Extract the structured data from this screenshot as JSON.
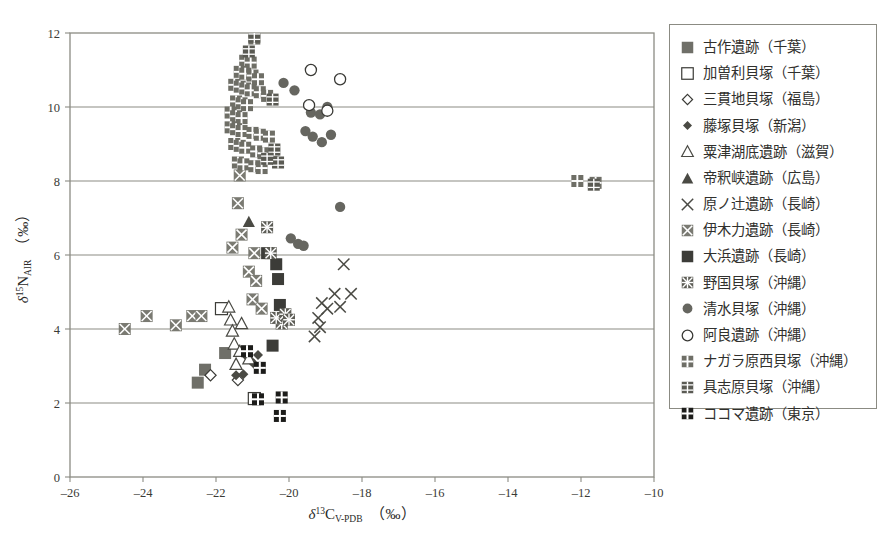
{
  "chart_data": {
    "type": "scatter",
    "title": "",
    "xlabel": "δ¹³C_V-PDB (‰)",
    "ylabel": "δ¹⁵N_AIR (‰)",
    "xlim": [
      -26,
      -10
    ],
    "ylim": [
      0,
      12
    ],
    "xticks": [
      -26,
      -24,
      -22,
      -20,
      -18,
      -16,
      -14,
      -12,
      -10
    ],
    "yticks": [
      0,
      2,
      4,
      6,
      8,
      10,
      12
    ],
    "xtick_labels": [
      "–26",
      "–24",
      "–22",
      "–20",
      "–18",
      "–16",
      "–14",
      "–12",
      "–10"
    ],
    "ytick_labels": [
      "0",
      "2",
      "4",
      "6",
      "8",
      "10",
      "12"
    ],
    "grid": "horizontal",
    "legend_position": "right-outside",
    "series": [
      {
        "name": "古作遺跡（千葉）",
        "marker": "filled-square",
        "color": "#6f6f68",
        "points": [
          [
            -22.3,
            2.9
          ],
          [
            -22.5,
            2.55
          ],
          [
            -21.75,
            3.35
          ]
        ]
      },
      {
        "name": "加曽利貝塚（千葉）",
        "marker": "open-square",
        "color": "#3a3a36",
        "points": [
          [
            -21.85,
            4.55
          ],
          [
            -20.95,
            2.12
          ]
        ]
      },
      {
        "name": "三貫地貝塚（福島）",
        "marker": "open-diamond",
        "color": "#3a3a36",
        "points": [
          [
            -22.15,
            2.75
          ],
          [
            -21.4,
            2.62
          ]
        ]
      },
      {
        "name": "藤塚貝塚（新潟）",
        "marker": "filled-diamond",
        "color": "#4a4a44",
        "points": [
          [
            -21.45,
            2.75
          ],
          [
            -21.25,
            2.78
          ],
          [
            -21.15,
            3.25
          ],
          [
            -21.05,
            3.15
          ],
          [
            -20.95,
            3.05
          ],
          [
            -20.85,
            3.3
          ]
        ]
      },
      {
        "name": "粟津湖底遺跡（滋賀）",
        "marker": "open-triangle",
        "color": "#4a4a44",
        "points": [
          [
            -21.65,
            4.6
          ],
          [
            -21.6,
            4.25
          ],
          [
            -21.55,
            3.95
          ],
          [
            -21.5,
            3.6
          ],
          [
            -21.35,
            3.4
          ],
          [
            -21.1,
            3.2
          ],
          [
            -21.3,
            4.15
          ],
          [
            -21.45,
            3.05
          ]
        ]
      },
      {
        "name": "帝釈峡遺跡（広島）",
        "marker": "filled-triangle",
        "color": "#4a4a44",
        "points": [
          [
            -21.1,
            6.9
          ]
        ]
      },
      {
        "name": "原ノ辻遺跡（長崎）",
        "marker": "cross-x",
        "color": "#4a4a44",
        "points": [
          [
            -18.5,
            5.75
          ],
          [
            -18.75,
            4.95
          ],
          [
            -18.3,
            4.95
          ],
          [
            -19.1,
            4.7
          ],
          [
            -18.95,
            4.55
          ],
          [
            -19.2,
            4.3
          ],
          [
            -19.15,
            4.05
          ],
          [
            -19.3,
            3.8
          ],
          [
            -18.6,
            4.6
          ]
        ]
      },
      {
        "name": "伊木力遺跡（長崎）",
        "marker": "x-in-square",
        "color": "#7a7a72",
        "points": [
          [
            -24.5,
            4.0
          ],
          [
            -23.9,
            4.35
          ],
          [
            -23.1,
            4.1
          ],
          [
            -22.65,
            4.35
          ],
          [
            -22.4,
            4.35
          ],
          [
            -21.4,
            7.4
          ],
          [
            -21.3,
            6.55
          ],
          [
            -21.55,
            6.2
          ],
          [
            -20.95,
            6.05
          ],
          [
            -21.0,
            4.8
          ],
          [
            -20.75,
            4.55
          ],
          [
            -21.35,
            8.15
          ],
          [
            -21.1,
            5.55
          ],
          [
            -20.9,
            5.3
          ]
        ]
      },
      {
        "name": "大浜遺跡（長崎）",
        "marker": "dark-square",
        "color": "#3c3c38",
        "points": [
          [
            -20.35,
            5.75
          ],
          [
            -20.3,
            5.35
          ],
          [
            -20.25,
            4.65
          ],
          [
            -20.6,
            6.05
          ],
          [
            -20.45,
            3.55
          ]
        ]
      },
      {
        "name": "野国貝塚（沖縄）",
        "marker": "asterisk-square",
        "color": "#5c5c55",
        "points": [
          [
            -20.6,
            6.75
          ],
          [
            -20.5,
            6.05
          ],
          [
            -20.2,
            4.15
          ],
          [
            -20.35,
            4.3
          ],
          [
            -20.1,
            4.4
          ],
          [
            -20.0,
            4.25
          ]
        ]
      },
      {
        "name": "清水貝塚（沖縄）",
        "marker": "filled-circle",
        "color": "#666660",
        "points": [
          [
            -19.4,
            9.85
          ],
          [
            -19.15,
            9.8
          ],
          [
            -18.95,
            10.0
          ],
          [
            -19.35,
            9.2
          ],
          [
            -19.1,
            9.05
          ],
          [
            -18.85,
            9.25
          ],
          [
            -19.55,
            9.35
          ],
          [
            -18.6,
            7.3
          ],
          [
            -19.95,
            6.45
          ],
          [
            -19.75,
            6.3
          ],
          [
            -19.6,
            6.25
          ],
          [
            -20.15,
            10.65
          ],
          [
            -19.85,
            10.45
          ]
        ]
      },
      {
        "name": "阿良遺跡（沖縄）",
        "marker": "open-circle",
        "color": "#3a3a36",
        "points": [
          [
            -19.4,
            11.0
          ],
          [
            -18.6,
            10.75
          ],
          [
            -19.45,
            10.05
          ],
          [
            -18.95,
            9.9
          ]
        ]
      },
      {
        "name": "ナガラ原西貝塚（沖縄）",
        "marker": "plus-square-light",
        "color": "#6e6e66",
        "points": [
          [
            -20.95,
            11.85
          ],
          [
            -21.2,
            11.25
          ],
          [
            -21.05,
            11.2
          ],
          [
            -21.35,
            10.95
          ],
          [
            -21.2,
            10.9
          ],
          [
            -21.0,
            10.85
          ],
          [
            -20.85,
            10.75
          ],
          [
            -21.5,
            10.6
          ],
          [
            -21.35,
            10.55
          ],
          [
            -21.2,
            10.5
          ],
          [
            -21.05,
            10.45
          ],
          [
            -20.8,
            10.4
          ],
          [
            -20.6,
            10.3
          ],
          [
            -21.45,
            10.15
          ],
          [
            -21.3,
            10.1
          ],
          [
            -21.15,
            10.05
          ],
          [
            -21.6,
            9.85
          ],
          [
            -21.45,
            9.75
          ],
          [
            -21.3,
            9.7
          ],
          [
            -21.6,
            9.45
          ],
          [
            -21.45,
            9.4
          ],
          [
            -21.3,
            9.35
          ],
          [
            -21.0,
            9.3
          ],
          [
            -20.8,
            9.25
          ],
          [
            -20.55,
            9.2
          ],
          [
            -21.5,
            9.0
          ],
          [
            -21.35,
            8.95
          ],
          [
            -21.2,
            8.9
          ],
          [
            -20.9,
            8.8
          ],
          [
            -20.7,
            8.75
          ],
          [
            -20.45,
            8.7
          ],
          [
            -21.4,
            8.5
          ],
          [
            -21.25,
            8.45
          ],
          [
            -20.95,
            8.4
          ],
          [
            -20.75,
            8.35
          ],
          [
            -11.6,
            7.95
          ],
          [
            -12.1,
            8.0
          ]
        ]
      },
      {
        "name": "具志原貝塚（沖縄）",
        "marker": "grid-square",
        "color": "#5a5a53",
        "points": [
          [
            -20.95,
            11.9
          ],
          [
            -21.1,
            11.5
          ],
          [
            -20.45,
            10.2
          ],
          [
            -20.4,
            8.85
          ],
          [
            -20.3,
            8.5
          ],
          [
            -20.6,
            8.6
          ],
          [
            -11.65,
            7.9
          ]
        ]
      },
      {
        "name": "ココマ遺跡（東京）",
        "marker": "plus-square-dark",
        "color": "#1c1c1a",
        "points": [
          [
            -21.15,
            3.4
          ],
          [
            -20.8,
            2.95
          ],
          [
            -20.85,
            2.1
          ],
          [
            -20.2,
            2.15
          ],
          [
            -20.25,
            1.65
          ]
        ]
      }
    ]
  },
  "legend": {
    "items": [
      {
        "label": "古作遺跡（千葉）",
        "marker": "filled-square"
      },
      {
        "label": "加曽利貝塚（千葉）",
        "marker": "open-square"
      },
      {
        "label": "三貫地貝塚（福島）",
        "marker": "open-diamond"
      },
      {
        "label": "藤塚貝塚（新潟）",
        "marker": "filled-diamond"
      },
      {
        "label": "粟津湖底遺跡（滋賀）",
        "marker": "open-triangle"
      },
      {
        "label": "帝釈峡遺跡（広島）",
        "marker": "filled-triangle"
      },
      {
        "label": "原ノ辻遺跡（長崎）",
        "marker": "cross-x"
      },
      {
        "label": "伊木力遺跡（長崎）",
        "marker": "x-in-square"
      },
      {
        "label": "大浜遺跡（長崎）",
        "marker": "dark-square"
      },
      {
        "label": "野国貝塚（沖縄）",
        "marker": "asterisk-square"
      },
      {
        "label": "清水貝塚（沖縄）",
        "marker": "filled-circle"
      },
      {
        "label": "阿良遺跡（沖縄）",
        "marker": "open-circle"
      },
      {
        "label": "ナガラ原西貝塚（沖縄）",
        "marker": "plus-square-light"
      },
      {
        "label": "具志原貝塚（沖縄）",
        "marker": "grid-square"
      },
      {
        "label": "ココマ遺跡（東京）",
        "marker": "plus-square-dark"
      }
    ]
  },
  "axes": {
    "x_title_delta": "δ",
    "x_title_sup": "13",
    "x_title_main": "C",
    "x_title_sub": "V-PDB",
    "x_title_unit": "（‰）",
    "y_title_delta": "δ",
    "y_title_sup": "15",
    "y_title_main": "N",
    "y_title_sub": "AIR",
    "y_title_unit": "（‰）"
  },
  "colors": {
    "frame": "#8b8b83",
    "grid": "#8b8b83",
    "marker_gray": "#6f6f68",
    "marker_dark": "#1c1c1a",
    "background": "#ffffff"
  }
}
